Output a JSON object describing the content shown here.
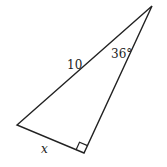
{
  "diagram": {
    "type": "right-triangle",
    "vertices": {
      "top": [
        152,
        6
      ],
      "left": [
        17,
        125
      ],
      "right_angle": [
        84,
        153
      ]
    },
    "labels": {
      "hypotenuse": "10",
      "angle": "36°",
      "short_leg": "x"
    },
    "right_angle_marker": true,
    "stroke_color": "#222222"
  }
}
